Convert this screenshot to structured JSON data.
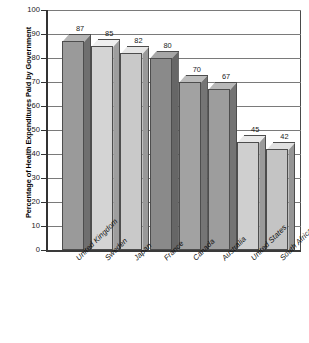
{
  "chart_data": {
    "type": "bar",
    "title": "",
    "subtitle": "",
    "xlabel": "",
    "ylabel": "Percentage of Health Expenditures Paid by Government",
    "ylim": [
      0,
      100
    ],
    "ytick_labels": [
      "100",
      "90",
      "80",
      "70",
      "60",
      "50",
      "40",
      "30",
      "20",
      "10",
      "0"
    ],
    "ytick_values": [
      100,
      90,
      80,
      70,
      60,
      50,
      40,
      30,
      20,
      10,
      0
    ],
    "grid": true,
    "grid_axis": "y",
    "legend": false,
    "legend_position": "none",
    "style": "3d-bars",
    "categories": [
      "United Kingdom",
      "Sweden",
      "Japan",
      "France",
      "Canada",
      "Australia",
      "United States",
      "South Africa"
    ],
    "values": [
      87,
      85,
      82,
      80,
      70,
      67,
      45,
      42
    ],
    "data_labels": [
      "87",
      "85",
      "82",
      "80",
      "70",
      "67",
      "45",
      "42"
    ],
    "bar_colors": [
      "#9a9a9a",
      "#d4d4d4",
      "#c9c9c9",
      "#8a8a8a",
      "#a2a2a2",
      "#9d9d9d",
      "#cfcfcf",
      "#c4c4c4"
    ],
    "bar_side_colors": [
      "#6f6f6f",
      "#9e9e9e",
      "#999999",
      "#666666",
      "#757575",
      "#737373",
      "#9a9a9a",
      "#949494"
    ],
    "bar_top_colors": [
      "#b5b5b5",
      "#efefef",
      "#e6e6e6",
      "#a6a6a6",
      "#bcbcbc",
      "#b8b8b8",
      "#e9e9e9",
      "#e0e0e0"
    ],
    "axis_color": "#333333",
    "gridline_color": "#7a7a7a",
    "background": "#ffffff"
  }
}
